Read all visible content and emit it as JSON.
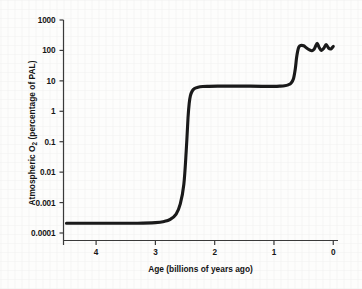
{
  "chart_data": {
    "type": "line",
    "title": "",
    "xlabel": "Age (billions of years ago)",
    "ylabel_prefix": "Atmospheric O",
    "ylabel_sub": "2",
    "ylabel_suffix": " (percentage of PAL)",
    "ylabel_full": "Atmospheric O2 (percentage of PAL)",
    "yscale": "log",
    "xscale": "linear",
    "xlim": [
      4.55,
      -0.08
    ],
    "ylim": [
      0.0001,
      1000
    ],
    "grid": false,
    "legend": null,
    "xticks": [
      4,
      3,
      2,
      1,
      0
    ],
    "xtick_labels": [
      "4",
      "3",
      "2",
      "1",
      "0"
    ],
    "yticks": [
      1000,
      100,
      10,
      1,
      0.1,
      0.01,
      0.001,
      0.0001
    ],
    "ytick_labels": [
      "1000",
      "100",
      "10",
      "1",
      "0.1",
      "0.01",
      "0.001",
      "0.0001"
    ],
    "series": [
      {
        "name": "Atmospheric oxygen",
        "color": "#1a1a1a",
        "linewidth": 3.1,
        "x": [
          4.5,
          4.2,
          3.9,
          3.6,
          3.3,
          3.0,
          2.85,
          2.75,
          2.65,
          2.58,
          2.52,
          2.48,
          2.45,
          2.43,
          2.41,
          2.38,
          2.34,
          2.28,
          2.2,
          2.1,
          1.95,
          1.8,
          1.6,
          1.4,
          1.2,
          1.0,
          0.9,
          0.82,
          0.76,
          0.71,
          0.67,
          0.64,
          0.62,
          0.6,
          0.58,
          0.55,
          0.5,
          0.45,
          0.4,
          0.36,
          0.32,
          0.3,
          0.27,
          0.24,
          0.2,
          0.16,
          0.12,
          0.08,
          0.04,
          0.0
        ],
        "y": [
          0.00021,
          0.00021,
          0.00021,
          0.00021,
          0.00021,
          0.00022,
          0.00024,
          0.00028,
          0.00042,
          0.0009,
          0.004,
          0.05,
          0.6,
          1.8,
          3.2,
          4.6,
          5.6,
          6.2,
          6.5,
          6.6,
          6.7,
          6.7,
          6.7,
          6.7,
          6.6,
          6.6,
          6.7,
          6.9,
          7.4,
          8.5,
          12.0,
          25.0,
          55.0,
          95.0,
          130.0,
          145.0,
          142.0,
          120.0,
          104.0,
          98.0,
          112.0,
          135.0,
          170.0,
          128.0,
          100.0,
          118.0,
          155.0,
          120.0,
          112.0,
          135.0
        ]
      }
    ],
    "annotations": []
  }
}
